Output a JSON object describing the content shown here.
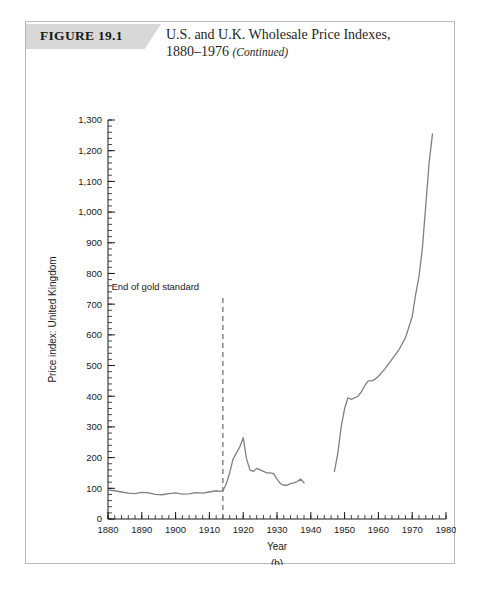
{
  "figure": {
    "label": "FIGURE 19.1",
    "title_line1": "U.S. and U.K. Wholesale Price Indexes,",
    "title_line2": "1880–1976",
    "title_continued": "(Continued)",
    "panel": "(b)",
    "banner_color": "#d8d8d8",
    "border_color": "#b9b9b9"
  },
  "chart_data": {
    "type": "line",
    "title": "U.S. and U.K. Wholesale Price Indexes, 1880–1976 (Continued)",
    "panel_label": "(b)",
    "xlabel": "Year",
    "ylabel": "Price index: United Kingdom",
    "xlim": [
      1880,
      1980
    ],
    "ylim": [
      0,
      1300
    ],
    "xticks": [
      1880,
      1890,
      1900,
      1910,
      1920,
      1930,
      1940,
      1950,
      1960,
      1970,
      1980
    ],
    "xtick_labels": [
      "1880",
      "1890",
      "1900",
      "1910",
      "1920",
      "1930",
      "1940",
      "1950",
      "1960",
      "1970",
      "1980"
    ],
    "x_minor_tick_step": 2,
    "yticks": [
      0,
      100,
      200,
      300,
      400,
      500,
      600,
      700,
      800,
      900,
      1000,
      1100,
      1200,
      1300
    ],
    "ytick_labels": [
      "0",
      "100",
      "200",
      "300",
      "400",
      "500",
      "600",
      "700",
      "800",
      "900",
      "1,000",
      "1,100",
      "1,200",
      "1,300"
    ],
    "y_minor_tick_step": 20,
    "grid": false,
    "legend": null,
    "line_color": "#808080",
    "annotations": [
      {
        "text": "End of gold standard",
        "x": 1914,
        "label_x": 1894,
        "label_y": 745,
        "line_style": "dashed",
        "line_top": 720,
        "line_bottom": 0
      }
    ],
    "series": [
      {
        "name": "Price index: United Kingdom",
        "segments": [
          {
            "name": "1880-1938",
            "x": [
              1880,
              1882,
              1884,
              1886,
              1888,
              1890,
              1892,
              1894,
              1896,
              1898,
              1900,
              1902,
              1904,
              1906,
              1908,
              1910,
              1912,
              1913,
              1914,
              1915,
              1916,
              1917,
              1918,
              1919,
              1920,
              1921,
              1922,
              1923,
              1924,
              1925,
              1926,
              1927,
              1928,
              1929,
              1930,
              1931,
              1932,
              1933,
              1934,
              1935,
              1936,
              1937,
              1938
            ],
            "y": [
              95,
              92,
              88,
              84,
              83,
              87,
              85,
              80,
              79,
              83,
              85,
              81,
              82,
              86,
              84,
              88,
              92,
              90,
              92,
              115,
              150,
              195,
              215,
              235,
              265,
              195,
              160,
              155,
              165,
              160,
              155,
              150,
              150,
              148,
              130,
              115,
              110,
              110,
              115,
              118,
              122,
              130,
              118
            ]
          },
          {
            "name": "1947-1976",
            "x": [
              1947,
              1948,
              1949,
              1950,
              1951,
              1952,
              1953,
              1954,
              1955,
              1956,
              1957,
              1958,
              1959,
              1960,
              1962,
              1964,
              1966,
              1968,
              1970,
              1971,
              1972,
              1973,
              1974,
              1975,
              1976
            ],
            "y": [
              155,
              215,
              300,
              360,
              395,
              390,
              395,
              400,
              415,
              435,
              450,
              450,
              455,
              465,
              490,
              520,
              550,
              590,
              660,
              730,
              790,
              880,
              1020,
              1160,
              1255
            ]
          }
        ]
      }
    ]
  }
}
